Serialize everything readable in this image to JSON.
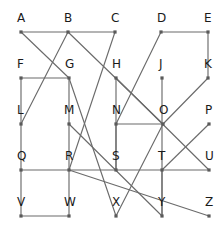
{
  "figure": {
    "kind": "graph-diagram",
    "background_color": "#ffffff",
    "edge_color": "#6b6b6b",
    "vertex_color": "#5a5a5a",
    "label_color": "#1a1a1a",
    "width": 224,
    "height": 226
  },
  "chart_data": {
    "type": "diagram",
    "title": "",
    "xlabel": "",
    "ylabel": "",
    "layout": "5x5 lettered grid of vertices connected by straight line segments",
    "vertex_labels": [
      "A",
      "B",
      "C",
      "D",
      "E",
      "F",
      "G",
      "H",
      "J",
      "K",
      "L",
      "M",
      "N",
      "O",
      "P",
      "Q",
      "R",
      "S",
      "T",
      "U",
      "V",
      "W",
      "X",
      "Y",
      "Z"
    ],
    "vertices": [
      {
        "id": "A",
        "label": "A",
        "x": 21,
        "y": 32,
        "label_dx": -4,
        "label_dy": -20
      },
      {
        "id": "B",
        "label": "B",
        "x": 68,
        "y": 32,
        "label_dx": -4,
        "label_dy": -20
      },
      {
        "id": "C",
        "label": "C",
        "x": 115,
        "y": 32,
        "label_dx": -4,
        "label_dy": -20
      },
      {
        "id": "D",
        "label": "D",
        "x": 161,
        "y": 32,
        "label_dx": -4,
        "label_dy": -20
      },
      {
        "id": "E",
        "label": "E",
        "x": 208,
        "y": 32,
        "label_dx": -4,
        "label_dy": -20
      },
      {
        "id": "F",
        "label": "F",
        "x": 21,
        "y": 78,
        "label_dx": -4,
        "label_dy": -20
      },
      {
        "id": "G",
        "label": "G",
        "x": 69,
        "y": 78,
        "label_dx": -4,
        "label_dy": -20
      },
      {
        "id": "H",
        "label": "H",
        "x": 116,
        "y": 78,
        "label_dx": -4,
        "label_dy": -20
      },
      {
        "id": "J",
        "label": "J",
        "x": 162,
        "y": 78,
        "label_dx": -3,
        "label_dy": -20
      },
      {
        "id": "K",
        "label": "K",
        "x": 208,
        "y": 78,
        "label_dx": -4,
        "label_dy": -20
      },
      {
        "id": "L",
        "label": "L",
        "x": 21,
        "y": 124,
        "label_dx": -4,
        "label_dy": -20
      },
      {
        "id": "M",
        "label": "M",
        "x": 69,
        "y": 124,
        "label_dx": -5,
        "label_dy": -20
      },
      {
        "id": "N",
        "label": "N",
        "x": 116,
        "y": 124,
        "label_dx": -4,
        "label_dy": -20
      },
      {
        "id": "O",
        "label": "O",
        "x": 163,
        "y": 124,
        "label_dx": -4,
        "label_dy": -20
      },
      {
        "id": "P",
        "label": "P",
        "x": 209,
        "y": 124,
        "label_dx": -4,
        "label_dy": -20
      },
      {
        "id": "Q",
        "label": "Q",
        "x": 21,
        "y": 170,
        "label_dx": -4,
        "label_dy": -20
      },
      {
        "id": "R",
        "label": "R",
        "x": 69,
        "y": 170,
        "label_dx": -4,
        "label_dy": -20
      },
      {
        "id": "S",
        "label": "S",
        "x": 116,
        "y": 170,
        "label_dx": -4,
        "label_dy": -20
      },
      {
        "id": "T",
        "label": "T",
        "x": 162,
        "y": 170,
        "label_dx": -4,
        "label_dy": -20
      },
      {
        "id": "U",
        "label": "U",
        "x": 209,
        "y": 170,
        "label_dx": -4,
        "label_dy": -20
      },
      {
        "id": "V",
        "label": "V",
        "x": 21,
        "y": 216,
        "label_dx": -4,
        "label_dy": -20
      },
      {
        "id": "W",
        "label": "W",
        "x": 69,
        "y": 216,
        "label_dx": -5,
        "label_dy": -20
      },
      {
        "id": "X",
        "label": "X",
        "x": 116,
        "y": 216,
        "label_dx": -4,
        "label_dy": -20
      },
      {
        "id": "Y",
        "label": "Y",
        "x": 162,
        "y": 216,
        "label_dx": -4,
        "label_dy": -20
      },
      {
        "id": "Z",
        "label": "Z",
        "x": 209,
        "y": 216,
        "label_dx": -4,
        "label_dy": -20
      }
    ],
    "edges": [
      {
        "from": "A",
        "to": "B"
      },
      {
        "from": "B",
        "to": "C"
      },
      {
        "from": "D",
        "to": "E"
      },
      {
        "from": "A",
        "to": "G"
      },
      {
        "from": "B",
        "to": "L"
      },
      {
        "from": "B",
        "to": "O"
      },
      {
        "from": "C",
        "to": "R"
      },
      {
        "from": "D",
        "to": "N"
      },
      {
        "from": "E",
        "to": "K"
      },
      {
        "from": "K",
        "to": "O"
      },
      {
        "from": "F",
        "to": "G"
      },
      {
        "from": "F",
        "to": "L"
      },
      {
        "from": "G",
        "to": "M"
      },
      {
        "from": "G",
        "to": "X"
      },
      {
        "from": "L",
        "to": "Q"
      },
      {
        "from": "Q",
        "to": "V"
      },
      {
        "from": "V",
        "to": "W"
      },
      {
        "from": "W",
        "to": "R"
      },
      {
        "from": "R",
        "to": "M"
      },
      {
        "from": "M",
        "to": "Y"
      },
      {
        "from": "H",
        "to": "S"
      },
      {
        "from": "H",
        "to": "U"
      },
      {
        "from": "N",
        "to": "O"
      },
      {
        "from": "N",
        "to": "S"
      },
      {
        "from": "J",
        "to": "Y"
      },
      {
        "from": "O",
        "to": "X"
      },
      {
        "from": "P",
        "to": "T"
      },
      {
        "from": "Q",
        "to": "U"
      },
      {
        "from": "R",
        "to": "Z"
      },
      {
        "from": "T",
        "to": "Y"
      }
    ]
  }
}
